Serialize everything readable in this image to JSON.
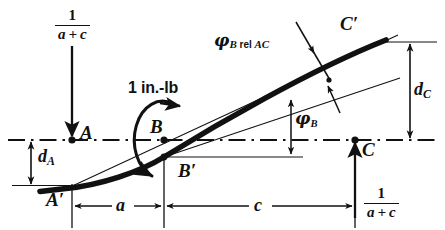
{
  "figure": {
    "domain": "engineering-diagram"
  },
  "labels": {
    "point_A": "A",
    "point_B": "B",
    "point_C": "C",
    "point_A_prime": "A′",
    "point_B_prime": "B′",
    "point_C_prime": "C′",
    "moment": "1 in.-lb",
    "phi_b_rel_ac_symbol": "φ",
    "phi_b_rel_ac_sub": "B",
    "phi_b_rel_ac_rel": " rel ",
    "phi_b_rel_ac_ac": "AC",
    "phi_b_symbol": "φ",
    "phi_b_sub": "B",
    "d_a_symbol": "d",
    "d_a_sub": "A",
    "d_c_symbol": "d",
    "d_c_sub": "C",
    "dim_a": "a",
    "dim_c": "c",
    "reaction_numerator": "1",
    "reaction_denominator": "a + c"
  },
  "geometry": {
    "axis_y": 140,
    "point_A_x": 72,
    "point_B_x": 164,
    "point_C_x": 355,
    "point_A_prime": [
      72,
      186
    ],
    "point_B_prime": [
      164,
      157
    ],
    "point_C_prime": [
      390,
      40
    ],
    "dim_line_y": 206,
    "d_a_top_y": 140,
    "d_a_bottom_y": 185,
    "d_c_top_y": 42,
    "d_c_bottom_y": 140
  },
  "colors": {
    "ink": "#111111",
    "background": "#ffffff"
  },
  "icons": {
    "load_arrow_down": "arrow-down-icon",
    "reaction_arrow_up": "arrow-up-icon",
    "moment_arrow": "curved-moment-arrow-icon",
    "dimension_arrow": "double-headed-arrow-icon"
  }
}
